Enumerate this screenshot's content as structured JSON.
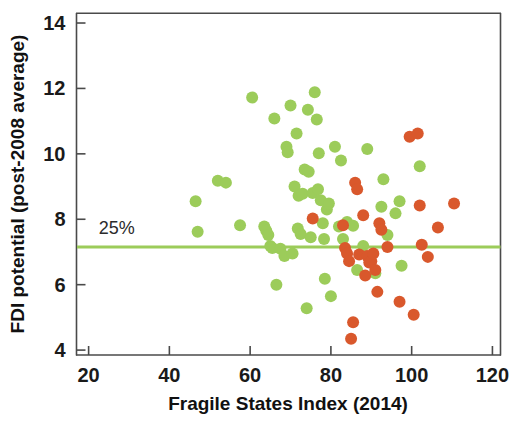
{
  "chart_data": {
    "type": "scatter",
    "title": "",
    "xlabel": "Fragile States Index (2014)",
    "ylabel": "FDI potential (post-2008 average)",
    "xlim": [
      17,
      122
    ],
    "ylim": [
      3.85,
      14.3
    ],
    "xticks": [
      20,
      40,
      60,
      80,
      100,
      120
    ],
    "yticks": [
      4,
      6,
      8,
      10,
      12,
      14
    ],
    "grid": false,
    "legend": "none",
    "marker_size_px": 12,
    "colors": {
      "green": "#9ccc5a",
      "orange": "#d9582c",
      "axis": "#4a4a4a",
      "text": "#111111",
      "reference_line": "#9ccc5a"
    },
    "annotations": [
      {
        "name": "reference-line-25pct",
        "label": "25%",
        "type": "hline",
        "y": 7.15,
        "color": "#9ccc5a",
        "label_x": 22.5,
        "label_y": 7.55
      }
    ],
    "series": [
      {
        "name": "green",
        "color": "#9ccc5a",
        "points": [
          [
            46.5,
            8.55
          ],
          [
            47.0,
            7.62
          ],
          [
            52.0,
            9.18
          ],
          [
            54.0,
            9.12
          ],
          [
            57.5,
            7.82
          ],
          [
            60.5,
            11.72
          ],
          [
            63.5,
            7.78
          ],
          [
            64.0,
            7.65
          ],
          [
            64.5,
            7.52
          ],
          [
            65.0,
            7.18
          ],
          [
            65.5,
            7.12
          ],
          [
            66.0,
            11.08
          ],
          [
            66.5,
            6.0
          ],
          [
            67.5,
            7.1
          ],
          [
            68.5,
            6.88
          ],
          [
            69.0,
            10.22
          ],
          [
            69.3,
            10.05
          ],
          [
            70.0,
            11.48
          ],
          [
            70.5,
            6.95
          ],
          [
            71.0,
            9.0
          ],
          [
            71.5,
            10.62
          ],
          [
            71.8,
            7.72
          ],
          [
            72.0,
            8.72
          ],
          [
            72.5,
            7.55
          ],
          [
            73.0,
            8.78
          ],
          [
            73.5,
            9.52
          ],
          [
            74.0,
            5.28
          ],
          [
            74.3,
            11.35
          ],
          [
            74.5,
            9.45
          ],
          [
            75.0,
            7.45
          ],
          [
            75.5,
            8.8
          ],
          [
            76.0,
            11.88
          ],
          [
            76.5,
            11.05
          ],
          [
            76.8,
            8.92
          ],
          [
            77.0,
            10.02
          ],
          [
            77.5,
            8.58
          ],
          [
            78.0,
            7.88
          ],
          [
            78.3,
            7.4
          ],
          [
            78.5,
            6.18
          ],
          [
            79.0,
            8.3
          ],
          [
            79.5,
            8.48
          ],
          [
            80.0,
            5.65
          ],
          [
            81.0,
            10.22
          ],
          [
            82.0,
            7.78
          ],
          [
            82.5,
            9.8
          ],
          [
            83.0,
            7.4
          ],
          [
            84.0,
            7.92
          ],
          [
            85.5,
            7.8
          ],
          [
            86.5,
            6.45
          ],
          [
            88.0,
            7.18
          ],
          [
            89.0,
            10.15
          ],
          [
            91.0,
            6.35
          ],
          [
            92.5,
            8.38
          ],
          [
            93.0,
            9.22
          ],
          [
            94.0,
            7.52
          ],
          [
            96.0,
            8.18
          ],
          [
            97.0,
            8.55
          ],
          [
            97.5,
            6.58
          ],
          [
            102.0,
            9.62
          ]
        ]
      },
      {
        "name": "orange",
        "color": "#d9582c",
        "points": [
          [
            75.5,
            8.02
          ],
          [
            83.0,
            7.82
          ],
          [
            83.5,
            7.12
          ],
          [
            84.0,
            6.95
          ],
          [
            84.5,
            6.72
          ],
          [
            85.0,
            4.35
          ],
          [
            85.5,
            4.85
          ],
          [
            86.0,
            9.12
          ],
          [
            86.5,
            8.92
          ],
          [
            87.0,
            6.92
          ],
          [
            88.0,
            8.12
          ],
          [
            88.5,
            6.28
          ],
          [
            89.0,
            6.88
          ],
          [
            89.5,
            6.68
          ],
          [
            90.0,
            6.72
          ],
          [
            90.5,
            6.95
          ],
          [
            91.0,
            6.45
          ],
          [
            91.5,
            5.78
          ],
          [
            92.0,
            7.88
          ],
          [
            92.5,
            7.68
          ],
          [
            94.0,
            7.15
          ],
          [
            97.0,
            5.48
          ],
          [
            99.5,
            10.52
          ],
          [
            100.5,
            5.08
          ],
          [
            101.5,
            10.62
          ],
          [
            102.0,
            8.42
          ],
          [
            102.5,
            7.22
          ],
          [
            104.0,
            6.85
          ],
          [
            106.5,
            7.75
          ],
          [
            110.5,
            8.48
          ]
        ]
      }
    ]
  },
  "axis": {
    "x_tick_labels": [
      "20",
      "40",
      "60",
      "80",
      "100",
      "120"
    ],
    "y_tick_labels": [
      "4",
      "6",
      "8",
      "10",
      "12",
      "14"
    ],
    "x_title": "Fragile States Index (2014)",
    "y_title": "FDI potential (post-2008 average)"
  },
  "reference": {
    "label": "25%"
  }
}
